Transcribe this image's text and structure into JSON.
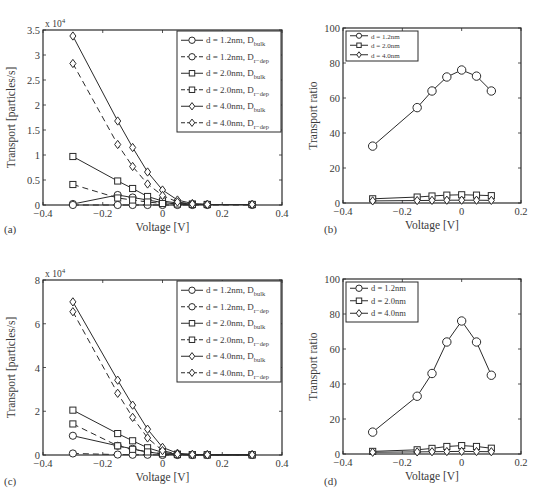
{
  "figure": {
    "panels": [
      "(a)",
      "(b)",
      "(c)",
      "(d)"
    ]
  },
  "chart_data": [
    {
      "id": "a",
      "type": "line",
      "panel_label": "(a)",
      "title": "",
      "xlabel": "Voltage [V]",
      "ylabel": "Transport [particles/s]",
      "y_multiplier": "x 10^4",
      "xlim": [
        -0.4,
        0.4
      ],
      "ylim": [
        0,
        3.5
      ],
      "xticks": [
        -0.4,
        -0.2,
        0,
        0.2,
        0.4
      ],
      "xtick_labels": [
        "−0.4",
        "−0.2",
        "0",
        "0.2",
        "0.4"
      ],
      "yticks": [
        0,
        0.5,
        1,
        1.5,
        2,
        2.5,
        3,
        3.5
      ],
      "ytick_labels": [
        "0",
        "0.5",
        "1",
        "1.5",
        "2",
        "2.5",
        "3",
        "3.5"
      ],
      "grid": false,
      "legend_position": "upper right",
      "x": [
        -0.3,
        -0.15,
        -0.1,
        -0.05,
        0,
        0.05,
        0.1,
        0.15,
        0.3
      ],
      "series": [
        {
          "name": "d = 1.2nm, D_bulk",
          "label": "d = 1.2nm, D",
          "sub": "bulk",
          "marker": "circle",
          "dash": false,
          "values": [
            0.02,
            0.2,
            0.15,
            0.1,
            0.05,
            0.02,
            0.01,
            0.01,
            0.01
          ]
        },
        {
          "name": "d = 1.2nm, D_r-dep",
          "label": "d = 1.2nm, D",
          "sub": "r−dep",
          "marker": "circle",
          "dash": true,
          "values": [
            0.0,
            0.0,
            0.0,
            0.0,
            0.0,
            0.0,
            0.0,
            0.0,
            0.0
          ]
        },
        {
          "name": "d = 2.0nm, D_bulk",
          "label": "d = 2.0nm, D",
          "sub": "bulk",
          "marker": "square",
          "dash": false,
          "values": [
            0.97,
            0.48,
            0.33,
            0.17,
            0.08,
            0.04,
            0.02,
            0.01,
            0.01
          ]
        },
        {
          "name": "d = 2.0nm, D_r-dep",
          "label": "d = 2.0nm, D",
          "sub": "r−dep",
          "marker": "square",
          "dash": true,
          "values": [
            0.41,
            0.14,
            0.1,
            0.06,
            0.03,
            0.02,
            0.01,
            0.01,
            0.01
          ]
        },
        {
          "name": "d = 4.0nm, D_bulk",
          "label": "d = 4.0nm, D",
          "sub": "bulk",
          "marker": "diamond",
          "dash": false,
          "values": [
            3.38,
            1.68,
            1.15,
            0.66,
            0.3,
            0.1,
            0.03,
            0.01,
            0.01
          ]
        },
        {
          "name": "d = 4.0nm, D_r-dep",
          "label": "d = 4.0nm, D",
          "sub": "r−dep",
          "marker": "diamond",
          "dash": true,
          "values": [
            2.83,
            1.21,
            0.77,
            0.42,
            0.19,
            0.06,
            0.02,
            0.01,
            0.01
          ]
        }
      ]
    },
    {
      "id": "b",
      "type": "line",
      "panel_label": "(b)",
      "title": "",
      "xlabel": "Voltage [V]",
      "ylabel": "Transport ratio",
      "xlim": [
        -0.4,
        0.2
      ],
      "ylim": [
        0,
        100
      ],
      "xticks": [
        -0.4,
        -0.2,
        0,
        0.2
      ],
      "xtick_labels": [
        "−0.4",
        "−0.2",
        "0",
        "0.2"
      ],
      "yticks": [
        0,
        20,
        40,
        60,
        80,
        100
      ],
      "ytick_labels": [
        "0",
        "20",
        "40",
        "60",
        "80",
        "100"
      ],
      "grid": false,
      "legend_position": "upper left",
      "x": [
        -0.3,
        -0.15,
        -0.1,
        -0.05,
        0,
        0.05,
        0.1
      ],
      "series": [
        {
          "name": "d = 1.2nm",
          "label": "d = 1.2nm",
          "sub": "",
          "marker": "circle",
          "dash": false,
          "values": [
            32.5,
            54.5,
            64,
            72,
            76,
            72.5,
            64
          ]
        },
        {
          "name": "d = 2.0nm",
          "label": "d = 2.0nm",
          "sub": "",
          "marker": "square",
          "dash": false,
          "values": [
            2.4,
            3.4,
            4.0,
            4.5,
            4.7,
            4.5,
            4.2
          ]
        },
        {
          "name": "d = 4.0nm",
          "label": "d = 4.0nm",
          "sub": "",
          "marker": "diamond",
          "dash": false,
          "values": [
            1.2,
            1.4,
            1.5,
            1.6,
            1.6,
            1.6,
            1.5
          ]
        }
      ]
    },
    {
      "id": "c",
      "type": "line",
      "panel_label": "(c)",
      "title": "",
      "xlabel": "Voltage [V]",
      "ylabel": "Transport [particles/s]",
      "y_multiplier": "x 10^4",
      "xlim": [
        -0.4,
        0.4
      ],
      "ylim": [
        0,
        8
      ],
      "xticks": [
        -0.4,
        -0.2,
        0,
        0.2,
        0.4
      ],
      "xtick_labels": [
        "−0.4",
        "−0.2",
        "0",
        "0.2",
        "0.4"
      ],
      "yticks": [
        0,
        2,
        4,
        6,
        8
      ],
      "ytick_labels": [
        "0",
        "2",
        "4",
        "6",
        "8"
      ],
      "grid": false,
      "legend_position": "upper right",
      "x": [
        -0.3,
        -0.15,
        -0.1,
        -0.05,
        0,
        0.05,
        0.1,
        0.15,
        0.3
      ],
      "series": [
        {
          "name": "d = 1.2nm, D_bulk",
          "label": "d = 1.2nm, D",
          "sub": "bulk",
          "marker": "circle",
          "dash": false,
          "values": [
            0.88,
            0.42,
            0.28,
            0.14,
            0.05,
            0.02,
            0.01,
            0.01,
            0.01
          ]
        },
        {
          "name": "d = 1.2nm, D_r-dep",
          "label": "d = 1.2nm, D",
          "sub": "r−dep",
          "marker": "circle",
          "dash": true,
          "values": [
            0.07,
            0.02,
            0.01,
            0.01,
            0.0,
            0.0,
            0.0,
            0.0,
            0.0
          ]
        },
        {
          "name": "d = 2.0nm, D_bulk",
          "label": "d = 2.0nm, D",
          "sub": "bulk",
          "marker": "square",
          "dash": false,
          "values": [
            2.05,
            0.98,
            0.65,
            0.33,
            0.12,
            0.04,
            0.02,
            0.01,
            0.01
          ]
        },
        {
          "name": "d = 2.0nm, D_r-dep",
          "label": "d = 2.0nm, D",
          "sub": "r−dep",
          "marker": "square",
          "dash": true,
          "values": [
            1.42,
            0.42,
            0.26,
            0.14,
            0.06,
            0.02,
            0.01,
            0.01,
            0.01
          ]
        },
        {
          "name": "d = 4.0nm, D_bulk",
          "label": "d = 4.0nm, D",
          "sub": "bulk",
          "marker": "diamond",
          "dash": false,
          "values": [
            7.0,
            3.42,
            2.28,
            1.18,
            0.35,
            0.08,
            0.03,
            0.01,
            0.01
          ]
        },
        {
          "name": "d = 4.0nm, D_r-dep",
          "label": "d = 4.0nm, D",
          "sub": "r−dep",
          "marker": "diamond",
          "dash": true,
          "values": [
            6.55,
            2.82,
            1.72,
            0.78,
            0.2,
            0.04,
            0.02,
            0.01,
            0.01
          ]
        }
      ]
    },
    {
      "id": "d",
      "type": "line",
      "panel_label": "(d)",
      "title": "",
      "xlabel": "Voltage [V]",
      "ylabel": "Transport ratio",
      "xlim": [
        -0.4,
        0.2
      ],
      "ylim": [
        0,
        100
      ],
      "xticks": [
        -0.4,
        -0.2,
        0,
        0.2
      ],
      "xtick_labels": [
        "−0.4",
        "−0.2",
        "0",
        "0.2"
      ],
      "yticks": [
        0,
        20,
        40,
        60,
        80,
        100
      ],
      "ytick_labels": [
        "0",
        "20",
        "40",
        "60",
        "80",
        "100"
      ],
      "grid": false,
      "legend_position": "upper left",
      "x": [
        -0.3,
        -0.15,
        -0.1,
        -0.05,
        0,
        0.05,
        0.1
      ],
      "series": [
        {
          "name": "d = 1.2nm",
          "label": "d = 1.2nm",
          "sub": "",
          "marker": "circle",
          "dash": false,
          "values": [
            12.5,
            33,
            46,
            64,
            76,
            64,
            45
          ]
        },
        {
          "name": "d = 2.0nm",
          "label": "d = 2.0nm",
          "sub": "",
          "marker": "square",
          "dash": false,
          "values": [
            1.5,
            2.4,
            3.2,
            4.3,
            4.8,
            4.3,
            3.3
          ]
        },
        {
          "name": "d = 4.0nm",
          "label": "d = 4.0nm",
          "sub": "",
          "marker": "diamond",
          "dash": false,
          "values": [
            1.0,
            1.2,
            1.3,
            1.4,
            1.5,
            1.4,
            1.3
          ]
        }
      ]
    }
  ],
  "layout": {
    "panels": [
      {
        "id": "a",
        "left": 43,
        "top": 30,
        "right": 282,
        "bottom": 205,
        "legend": {
          "x": 177,
          "y": 31,
          "w": 104,
          "h": 101,
          "row_h": 16.5
        },
        "label_pos": [
          4,
          233
        ]
      },
      {
        "id": "b",
        "left": 343,
        "top": 28,
        "right": 521,
        "bottom": 203,
        "legend": {
          "x": 346,
          "y": 31,
          "w": 72,
          "h": 30,
          "row_h": 9.5,
          "small": true
        },
        "label_pos": [
          324,
          233
        ]
      },
      {
        "id": "c",
        "left": 43,
        "top": 280,
        "right": 282,
        "bottom": 455,
        "legend": {
          "x": 177,
          "y": 281,
          "w": 104,
          "h": 101,
          "row_h": 16.5
        },
        "label_pos": [
          4,
          485
        ]
      },
      {
        "id": "d",
        "left": 343,
        "top": 279,
        "right": 521,
        "bottom": 454,
        "legend": {
          "x": 346,
          "y": 282,
          "w": 72,
          "h": 40,
          "row_h": 12.5,
          "small": false
        },
        "label_pos": [
          324,
          485
        ]
      }
    ]
  }
}
